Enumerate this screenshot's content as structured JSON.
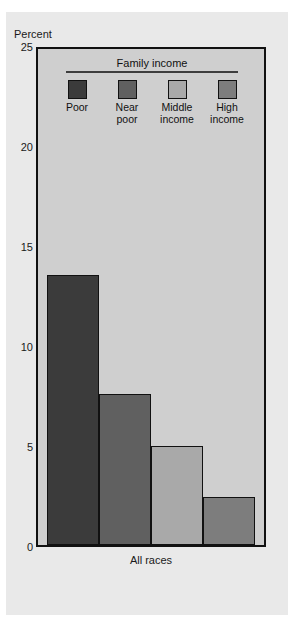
{
  "figure": {
    "title": "",
    "background_color": "#e9e9e9",
    "plot_background_color": "#cfcfcf",
    "axis_color": "#111111"
  },
  "axis": {
    "y_title": "Percent",
    "x_group_label": "All races",
    "y_ticks": [
      "25",
      "20",
      "15",
      "10",
      "5",
      "0"
    ]
  },
  "legend": {
    "title": "Family income",
    "items": [
      {
        "label": "Poor",
        "color": "#3b3b3b"
      },
      {
        "label": "Near\npoor",
        "color": "#606060"
      },
      {
        "label": "Middle\nincome",
        "color": "#a9a9a9"
      },
      {
        "label": "High\nincome",
        "color": "#7d7d7d"
      }
    ]
  },
  "chart_data": {
    "type": "bar",
    "title": "",
    "xlabel": "All races",
    "ylabel": "Percent",
    "ylim": [
      0,
      25
    ],
    "yticks": [
      0,
      5,
      10,
      15,
      20,
      25
    ],
    "grid": false,
    "legend_position": "inside-top",
    "legend_title": "Family income",
    "categories": [
      "All races"
    ],
    "series": [
      {
        "name": "Poor",
        "color": "#3b3b3b",
        "values": [
          13.6
        ]
      },
      {
        "name": "Near poor",
        "color": "#606060",
        "values": [
          7.6
        ]
      },
      {
        "name": "Middle income",
        "color": "#a9a9a9",
        "values": [
          5.0
        ]
      },
      {
        "name": "High income",
        "color": "#7d7d7d",
        "values": [
          2.4
        ]
      }
    ]
  }
}
